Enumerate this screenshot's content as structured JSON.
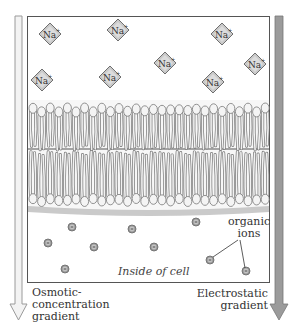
{
  "diagram": {
    "colors": {
      "frame": "#555555",
      "diamond_fill": "#c9c9c9",
      "diamond_stroke": "#6f6f6f",
      "membrane_head": "#f4f4f4",
      "membrane_stroke": "#777777",
      "ion_fill": "#9a9a9a",
      "left_arrow": "#d9d9d9",
      "right_arrow": "#9b9b9b"
    },
    "sodium_ions": {
      "label": "Na",
      "charge": "+",
      "positions": [
        [
          50,
          34
        ],
        [
          118,
          30
        ],
        [
          222,
          34
        ],
        [
          42,
          80
        ],
        [
          110,
          77
        ],
        [
          165,
          63
        ],
        [
          213,
          82
        ],
        [
          255,
          64
        ]
      ]
    },
    "organic_ions": {
      "symbol": "−",
      "positions": [
        [
          72,
          227
        ],
        [
          132,
          229
        ],
        [
          196,
          222
        ],
        [
          48,
          243
        ],
        [
          94,
          247
        ],
        [
          154,
          247
        ],
        [
          210,
          260
        ],
        [
          65,
          269
        ],
        [
          246,
          271
        ]
      ]
    },
    "labels": {
      "inside_cell": "Inside of cell",
      "organic_ions_line1": "organic",
      "organic_ions_line2": "ions",
      "osmotic_line1": "Osmotic-",
      "osmotic_line2": "concentration",
      "osmotic_line3": "gradient",
      "electrostatic_line1": "Electrostatic",
      "electrostatic_line2": "gradient"
    }
  }
}
